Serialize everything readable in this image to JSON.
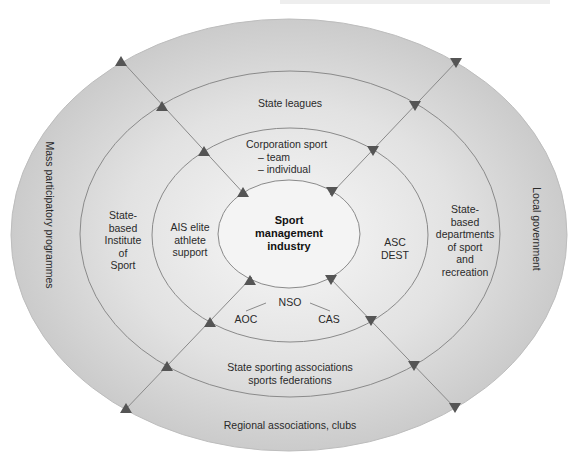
{
  "diagram": {
    "type": "concentric-ellipse",
    "colors": {
      "ring_outer": "#cdcdcd",
      "ring_2": "#d9d9d9",
      "ring_3": "#e6e6e6",
      "core": "#f3f3f3",
      "lines": "#8a8a8a",
      "arrows": "#555555",
      "text": "#2a2a2a"
    },
    "core": {
      "lines": [
        "Sport",
        "management",
        "industry"
      ]
    },
    "ring_3": {
      "top": {
        "lines": [
          "Corporation sport",
          "– team",
          "– individual"
        ]
      },
      "left": {
        "lines": [
          "AIS elite",
          "athlete",
          "support"
        ]
      },
      "right": {
        "lines": [
          "ASC",
          "DEST"
        ]
      },
      "bottom": {
        "center": "NSO",
        "left": "AOC",
        "right": "CAS"
      }
    },
    "ring_2": {
      "top": "State leagues",
      "left": {
        "lines": [
          "State-",
          "based",
          "Institute",
          "of",
          "Sport"
        ]
      },
      "right": {
        "lines": [
          "State-",
          "based",
          "departments",
          "of sport",
          "and",
          "recreation"
        ]
      },
      "bottom": {
        "lines": [
          "State sporting associations",
          "sports federations"
        ]
      }
    },
    "ring_outer": {
      "left": "Mass participatory programmes",
      "right": "Local government",
      "bottom": "Regional associations, clubs"
    },
    "arrows": {
      "upper_left_direction": "up",
      "upper_right_direction": "down",
      "lower_left_direction": "up",
      "lower_right_direction": "down"
    }
  }
}
